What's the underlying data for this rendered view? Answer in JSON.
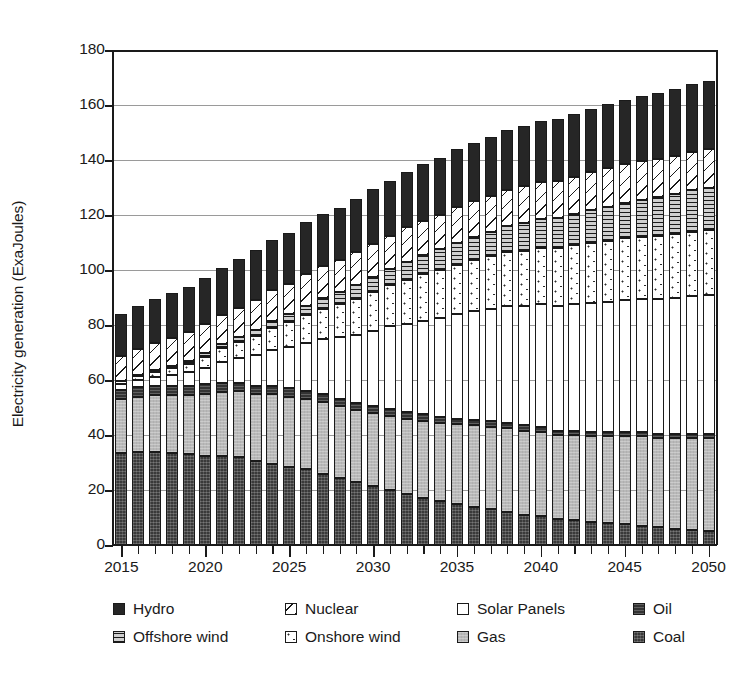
{
  "chart_data": {
    "type": "bar",
    "subtype": "stacked-bar",
    "title": "",
    "xlabel": "",
    "ylabel": "Electricity generation (ExaJoules)",
    "ylim": [
      0,
      180
    ],
    "ytick_step": 20,
    "yticks": [
      0,
      20,
      40,
      60,
      80,
      100,
      120,
      140,
      160,
      180
    ],
    "grid": "horizontal",
    "legend_position": "bottom",
    "legend_columns": 4,
    "legend_rows": 2,
    "categories": [
      "2015",
      "2016",
      "2017",
      "2018",
      "2019",
      "2020",
      "2021",
      "2022",
      "2023",
      "2024",
      "2025",
      "2026",
      "2027",
      "2028",
      "2029",
      "2030",
      "2031",
      "2032",
      "2033",
      "2034",
      "2035",
      "2036",
      "2037",
      "2038",
      "2039",
      "2040",
      "2041",
      "2042",
      "2043",
      "2044",
      "2045",
      "2046",
      "2047",
      "2048",
      "2049",
      "2050"
    ],
    "xtick_labels": [
      "2015",
      "2020",
      "2025",
      "2030",
      "2035",
      "2040",
      "2045",
      "2050"
    ],
    "stack_order_bottom_to_top": [
      "Coal",
      "Gas",
      "Oil",
      "Solar Panels",
      "Onshore wind",
      "Offshore wind",
      "Nuclear",
      "Hydro"
    ],
    "series": [
      {
        "name": "Coal",
        "pattern": "dark-solid",
        "values": [
          33.5,
          34.0,
          34.0,
          33.5,
          33.0,
          32.5,
          32.5,
          32.0,
          30.5,
          29.5,
          28.5,
          27.5,
          26.0,
          24.5,
          23.0,
          21.5,
          20.0,
          18.5,
          17.0,
          16.0,
          15.0,
          14.0,
          13.0,
          12.0,
          11.0,
          10.5,
          9.5,
          9.0,
          8.5,
          8.0,
          7.5,
          7.0,
          6.5,
          6.0,
          5.5,
          5.0
        ]
      },
      {
        "name": "Gas",
        "pattern": "light-gray",
        "values": [
          19.5,
          20.0,
          20.5,
          21.0,
          21.5,
          22.5,
          23.0,
          24.0,
          24.5,
          25.5,
          25.5,
          25.5,
          26.0,
          26.0,
          26.0,
          26.5,
          27.0,
          27.5,
          28.0,
          28.5,
          29.0,
          29.5,
          30.0,
          30.5,
          30.5,
          30.5,
          30.5,
          31.0,
          31.0,
          31.5,
          32.0,
          32.5,
          32.5,
          33.0,
          33.5,
          34.0
        ]
      },
      {
        "name": "Oil",
        "pattern": "dark-horizontal-line",
        "values": [
          3.5,
          3.5,
          3.5,
          3.5,
          3.5,
          3.5,
          3.5,
          3.0,
          3.0,
          3.0,
          3.0,
          3.0,
          3.0,
          2.5,
          2.5,
          2.5,
          2.5,
          2.5,
          2.5,
          2.0,
          2.0,
          2.0,
          2.0,
          2.0,
          2.0,
          2.0,
          1.5,
          1.5,
          1.5,
          1.5,
          1.5,
          1.5,
          1.5,
          1.5,
          1.5,
          1.5
        ]
      },
      {
        "name": "Solar Panels",
        "pattern": "white",
        "values": [
          2.0,
          2.5,
          3.0,
          4.0,
          5.0,
          6.0,
          7.5,
          9.0,
          11.0,
          13.0,
          15.0,
          17.5,
          20.0,
          22.5,
          25.0,
          27.5,
          30.0,
          32.0,
          34.0,
          36.0,
          38.0,
          39.5,
          41.0,
          42.5,
          43.5,
          44.5,
          45.5,
          46.0,
          47.0,
          47.5,
          48.0,
          48.5,
          49.0,
          49.5,
          50.0,
          50.5
        ]
      },
      {
        "name": "Onshore wind",
        "pattern": "sparse-dots",
        "values": [
          1.0,
          1.5,
          2.0,
          2.5,
          3.0,
          4.0,
          5.0,
          6.0,
          7.0,
          8.0,
          9.0,
          10.0,
          11.0,
          12.0,
          13.0,
          14.0,
          15.0,
          16.0,
          17.0,
          17.5,
          18.0,
          18.5,
          19.0,
          19.5,
          20.0,
          20.5,
          21.0,
          21.5,
          22.0,
          22.0,
          22.5,
          22.5,
          23.0,
          23.0,
          23.5,
          23.5
        ]
      },
      {
        "name": "Offshore wind",
        "pattern": "horizontal-lines",
        "values": [
          0.3,
          0.4,
          0.5,
          0.7,
          0.9,
          1.2,
          1.5,
          1.8,
          2.2,
          2.6,
          3.0,
          3.5,
          4.0,
          4.5,
          5.0,
          5.5,
          6.0,
          6.5,
          7.0,
          7.5,
          8.0,
          8.5,
          9.0,
          9.5,
          10.0,
          10.5,
          11.0,
          11.5,
          12.0,
          12.5,
          13.0,
          13.5,
          14.0,
          14.5,
          15.0,
          15.5
        ]
      },
      {
        "name": "Nuclear",
        "pattern": "diagonal-hatch",
        "values": [
          9.0,
          9.5,
          10.0,
          10.0,
          10.5,
          10.5,
          10.5,
          10.5,
          11.0,
          11.0,
          11.0,
          11.5,
          11.5,
          11.5,
          12.0,
          12.0,
          12.0,
          12.5,
          12.5,
          12.5,
          13.0,
          13.0,
          13.0,
          13.0,
          13.5,
          13.5,
          13.5,
          13.5,
          13.5,
          14.0,
          14.0,
          14.0,
          14.0,
          14.0,
          14.0,
          14.0
        ]
      },
      {
        "name": "Hydro",
        "pattern": "black",
        "values": [
          15.2,
          15.6,
          16.0,
          16.3,
          16.6,
          17.0,
          17.3,
          17.7,
          18.0,
          18.4,
          18.6,
          18.8,
          19.0,
          19.2,
          19.5,
          19.8,
          20.0,
          20.2,
          20.5,
          20.8,
          21.0,
          21.3,
          21.5,
          21.8,
          22.0,
          22.2,
          22.5,
          22.8,
          23.0,
          23.2,
          23.5,
          23.8,
          24.0,
          24.2,
          24.5,
          24.8
        ]
      }
    ],
    "totals": [
      84.0,
      87.0,
      89.5,
      91.5,
      94.0,
      97.2,
      100.8,
      104.0,
      107.2,
      111.0,
      113.6,
      117.3,
      120.5,
      122.7,
      126.0,
      129.3,
      132.5,
      135.7,
      138.5,
      140.8,
      144.0,
      146.3,
      148.5,
      150.8,
      152.5,
      154.2,
      155.0,
      156.8,
      158.5,
      160.2,
      161.0,
      162.3,
      164.5,
      165.7,
      167.5,
      168.8
    ]
  },
  "legend": {
    "row0": [
      {
        "label": "Hydro",
        "pattern": "black"
      },
      {
        "label": "Nuclear",
        "pattern": "diagonal-hatch"
      },
      {
        "label": "Solar Panels",
        "pattern": "white"
      },
      {
        "label": "Oil",
        "pattern": "dark-horizontal-line"
      }
    ],
    "row1": [
      {
        "label": "Offshore wind",
        "pattern": "horizontal-lines"
      },
      {
        "label": "Onshore wind",
        "pattern": "sparse-dots"
      },
      {
        "label": "Gas",
        "pattern": "light-gray"
      },
      {
        "label": "Coal",
        "pattern": "dark-solid"
      }
    ]
  },
  "colors": {
    "axis": "#1a1a1a",
    "grid": "#9a9a9a",
    "coal": "#3a3a3a",
    "gas": "#b9b9b9",
    "oil": "#333333",
    "solar": "#ffffff",
    "onshore": "#ffffff",
    "offshore": "#cfcfcf",
    "nuclear": "#ffffff",
    "hydro": "#262626"
  }
}
